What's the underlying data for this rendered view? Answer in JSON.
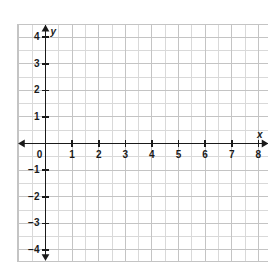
{
  "chart_data": {
    "type": "scatter",
    "title": "",
    "subtitle": "",
    "xlabel": "x",
    "ylabel": "y",
    "xlim": [
      0,
      8
    ],
    "ylim": [
      -4,
      4
    ],
    "x_tick_labels": [
      "0",
      "1",
      "2",
      "3",
      "4",
      "5",
      "6",
      "7",
      "8"
    ],
    "x_tick_values": [
      0,
      1,
      2,
      3,
      4,
      5,
      6,
      7,
      8
    ],
    "y_tick_labels": [
      "4",
      "3",
      "2",
      "1",
      "0",
      "−1",
      "−2",
      "−3",
      "−4"
    ],
    "y_tick_values": [
      4,
      3,
      2,
      1,
      0,
      -1,
      -2,
      -3,
      -4
    ],
    "grid": true,
    "minor_grid": true,
    "minor_grid_step": 0.5,
    "legend": false,
    "series": [],
    "values": [],
    "annotations": [],
    "axis_arrows": [
      "x-left",
      "x-right",
      "y-up",
      "y-down"
    ]
  },
  "colors": {
    "background": "#ffffff",
    "grid_minor": "#d9d9d9",
    "grid_major": "#c4c4c4",
    "axis": "#1a1a1a",
    "label_text": "#1a1a1a",
    "frame": "#c4c4c4"
  },
  "labels": {
    "x_axis": "x",
    "y_axis": "y"
  },
  "x_ticks": [
    {
      "label": "0",
      "value": 0
    },
    {
      "label": "1",
      "value": 1
    },
    {
      "label": "2",
      "value": 2
    },
    {
      "label": "3",
      "value": 3
    },
    {
      "label": "4",
      "value": 4
    },
    {
      "label": "5",
      "value": 5
    },
    {
      "label": "6",
      "value": 6
    },
    {
      "label": "7",
      "value": 7
    },
    {
      "label": "8",
      "value": 8
    }
  ],
  "y_ticks": [
    {
      "label": "4",
      "value": 4
    },
    {
      "label": "3",
      "value": 3
    },
    {
      "label": "2",
      "value": 2
    },
    {
      "label": "1",
      "value": 1
    },
    {
      "label": "−1",
      "value": -1
    },
    {
      "label": "−2",
      "value": -2
    },
    {
      "label": "−3",
      "value": -3
    },
    {
      "label": "−4",
      "value": -4
    }
  ]
}
